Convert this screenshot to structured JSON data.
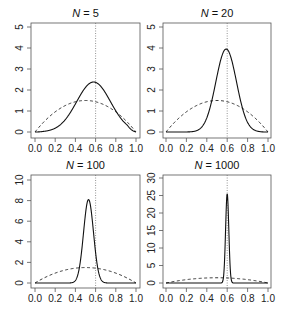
{
  "chart_data": [
    {
      "type": "line",
      "title": "N = 5",
      "title_var": "N",
      "title_val": "5",
      "xlabel": "",
      "ylabel": "",
      "xlim": [
        0,
        1
      ],
      "ylim": [
        0,
        5
      ],
      "xticks": [
        "0.0",
        "0.2",
        "0.4",
        "0.6",
        "0.8",
        "1.0"
      ],
      "yticks": [
        "0",
        "1",
        "2",
        "3",
        "4",
        "5"
      ],
      "vline": 0.6,
      "series": [
        {
          "name": "posterior",
          "style": "solid",
          "mode": 0.58,
          "peak": 2.38
        },
        {
          "name": "prior",
          "style": "dashed",
          "dist": "beta(2,2)",
          "peak": 1.5
        }
      ]
    },
    {
      "type": "line",
      "title": "N = 20",
      "title_var": "N",
      "title_val": "20",
      "xlabel": "",
      "ylabel": "",
      "xlim": [
        0,
        1
      ],
      "ylim": [
        0,
        5
      ],
      "xticks": [
        "0.0",
        "0.2",
        "0.4",
        "0.6",
        "0.8",
        "1.0"
      ],
      "yticks": [
        "0",
        "1",
        "2",
        "3",
        "4",
        "5"
      ],
      "vline": 0.6,
      "series": [
        {
          "name": "posterior",
          "style": "solid",
          "mode": 0.59,
          "peak": 3.95
        },
        {
          "name": "prior",
          "style": "dashed",
          "dist": "beta(2,2)",
          "peak": 1.5
        }
      ]
    },
    {
      "type": "line",
      "title": "N = 100",
      "title_var": "N",
      "title_val": "100",
      "xlabel": "",
      "ylabel": "",
      "xlim": [
        0,
        1
      ],
      "ylim": [
        0,
        10
      ],
      "xticks": [
        "0.0",
        "0.2",
        "0.4",
        "0.6",
        "0.8",
        "1.0"
      ],
      "yticks": [
        "0",
        "2",
        "4",
        "6",
        "8",
        "10"
      ],
      "vline": 0.6,
      "series": [
        {
          "name": "posterior",
          "style": "solid",
          "mode": 0.53,
          "peak": 8.1
        },
        {
          "name": "prior",
          "style": "dashed",
          "dist": "beta(2,2)",
          "peak": 1.5
        }
      ]
    },
    {
      "type": "line",
      "title": "N = 1000",
      "title_var": "N",
      "title_val": "1000",
      "xlabel": "",
      "ylabel": "",
      "xlim": [
        0,
        1
      ],
      "ylim": [
        0,
        30
      ],
      "xticks": [
        "0.0",
        "0.2",
        "0.4",
        "0.6",
        "0.8",
        "1.0"
      ],
      "yticks": [
        "0",
        "5",
        "10",
        "15",
        "20",
        "25",
        "30"
      ],
      "vline": 0.6,
      "series": [
        {
          "name": "posterior",
          "style": "solid",
          "mode": 0.6,
          "peak": 25.5
        },
        {
          "name": "prior",
          "style": "dashed",
          "dist": "beta(2,2)",
          "peak": 1.5
        }
      ]
    }
  ],
  "panels_layout": [
    {
      "box": [
        31,
        23,
        140,
        138
      ],
      "x0": 35,
      "x1": 136,
      "y0": 132,
      "ytop": 27,
      "ymax": 5
    },
    {
      "box": [
        163,
        23,
        271,
        138
      ],
      "x0": 166,
      "x1": 268,
      "y0": 132,
      "ytop": 27,
      "ymax": 5
    },
    {
      "box": [
        31,
        175,
        140,
        288
      ],
      "x0": 35,
      "x1": 136,
      "y0": 283,
      "ytop": 180,
      "ymax": 10
    },
    {
      "box": [
        163,
        175,
        271,
        288
      ],
      "x0": 166,
      "x1": 268,
      "y0": 283,
      "ytop": 178,
      "ymax": 30
    }
  ]
}
